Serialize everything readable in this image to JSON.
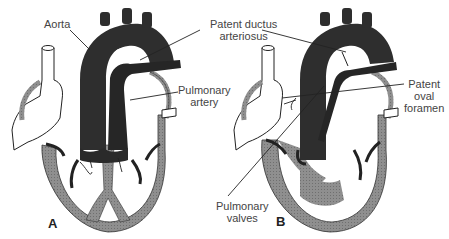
{
  "figure": {
    "panels": [
      {
        "letter": "A",
        "description": "normal fetal heart"
      },
      {
        "letter": "B",
        "description": "heart with pulmonary valve defect"
      }
    ],
    "labels": {
      "aorta": "Aorta",
      "pda_line1": "Patent ductus",
      "pda_line2": "arteriosus",
      "pa_line1": "Pulmonary",
      "pa_line2": "artery",
      "pfo_line1": "Patent",
      "pfo_line2": "oval",
      "pfo_line3": "foramen",
      "pv_line1": "Pulmonary",
      "pv_line2": "valves"
    },
    "colors": {
      "dark_vessel": "#2e2e2e",
      "muscle_gray": "#8a8a8a",
      "outline": "#1a1a1a",
      "label_text": "#444444"
    }
  }
}
